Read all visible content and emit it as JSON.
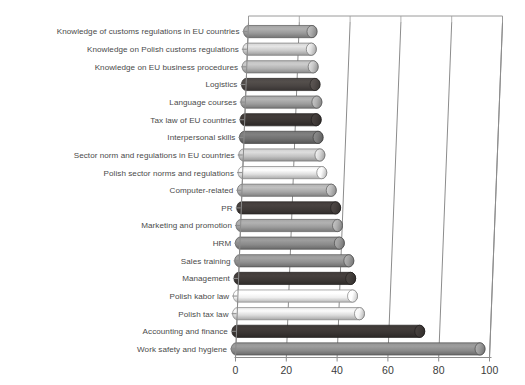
{
  "chart_data": {
    "type": "bar",
    "orientation": "horizontal",
    "style": "3d-cylinder",
    "title": "",
    "subtitle": "",
    "xlabel": "",
    "ylabel": "",
    "xlim": [
      0,
      100
    ],
    "xticks": [
      0,
      20,
      40,
      60,
      80,
      100
    ],
    "xtick_labels": [
      "0",
      "20",
      "40",
      "60",
      "80",
      "100"
    ],
    "grid": "vertical",
    "legend": "none",
    "categories": [
      "Knowledge of customs regulations in EU countries",
      "Knowledge on Polish customs regulations",
      "Knowledge on EU business procedures",
      "Logistics",
      "Language courses",
      "Tax law of EU countries",
      "Interpersonal skills",
      "Sector norm and regulations in EU countries",
      "Polish sector norms and regulations",
      "Computer-related",
      "PR",
      "Marketing and promotion",
      "HRM",
      "Sales training",
      "Management",
      "Polish kabor law",
      "Polish tax law",
      "Accounting and finance",
      "Work safety and hygiene"
    ],
    "values": [
      25,
      25,
      26,
      27,
      28,
      28,
      29,
      30,
      31,
      35,
      37,
      38,
      39,
      43,
      44,
      45,
      48,
      72,
      96
    ],
    "bar_colors": [
      "#9a9a9a",
      "#c9c9c9",
      "#b4b4b4",
      "#4a4543",
      "#9e9e9e",
      "#3a3533",
      "#707070",
      "#c2c2c2",
      "#e0e0e0",
      "#a8a8a8",
      "#3f3a38",
      "#9c9c9c",
      "#8a8a8a",
      "#8f8f8f",
      "#3d3836",
      "#efefef",
      "#dcdcdc",
      "#3a3533",
      "#8b8b8b"
    ],
    "axis_color": "#8c8c8c",
    "grid_color": "#a9a9a9",
    "background_color": "#ffffff"
  }
}
